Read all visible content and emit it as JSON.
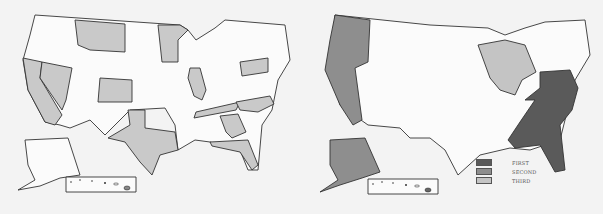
{
  "maps": [
    {
      "name": "highlighted-states-map",
      "highlighted_states": [
        "Montana",
        "Minnesota",
        "California",
        "Nevada",
        "Colorado",
        "Illinois",
        "Pennsylvania",
        "Texas",
        "Tennessee",
        "North Carolina",
        "Georgia",
        "Florida"
      ],
      "highlight_color": "#c9c9c9"
    },
    {
      "name": "regions-map",
      "regions": [
        {
          "rank": "FIRST",
          "color": "#5a5a5a",
          "area": "Southeast Atlantic"
        },
        {
          "rank": "SECOND",
          "color": "#8e8e8e",
          "area": "Pacific (WA, OR, CA, AK)"
        },
        {
          "rank": "THIRD",
          "color": "#c4c4c4",
          "area": "Great Lakes"
        }
      ]
    }
  ],
  "legend": {
    "items": [
      {
        "label": "FIRST",
        "color": "#5a5a5a"
      },
      {
        "label": "SECOND",
        "color": "#8e8e8e"
      },
      {
        "label": "THIRD",
        "color": "#c4c4c4"
      }
    ]
  }
}
